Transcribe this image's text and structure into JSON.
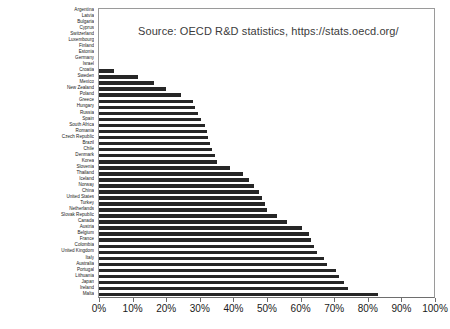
{
  "chart_data": {
    "type": "bar",
    "orientation": "horizontal",
    "title": "Source: OECD R&D statistics, https://stats.oecd.org/",
    "xlabel": "",
    "ylabel": "",
    "xlim": [
      0,
      100
    ],
    "xtick_labels": [
      "0%",
      "10%",
      "20%",
      "30%",
      "40%",
      "50%",
      "60%",
      "70%",
      "80%",
      "90%",
      "100%"
    ],
    "xtick_values": [
      0,
      10,
      20,
      30,
      40,
      50,
      60,
      70,
      80,
      90,
      100
    ],
    "grid": false,
    "legend": false,
    "bar_color": "#262626",
    "categories": [
      "Argentina",
      "Latvia",
      "Bulgaria",
      "Cyprus",
      "Switzerland",
      "Luxembourg",
      "Finland",
      "Estonia",
      "Germany",
      "Israel",
      "Croatia",
      "Sweden",
      "Mexico",
      "New Zealand",
      "Poland",
      "Greece",
      "Hungary",
      "Russia",
      "Spain",
      "South Africa",
      "Romania",
      "Czech Republic",
      "Brazil",
      "Chile",
      "Denmark",
      "Korea",
      "Slovenia",
      "Thailand",
      "Iceland",
      "Norway",
      "China",
      "United States",
      "Turkey",
      "Netherlands",
      "Slovak Republic",
      "Canada",
      "Austria",
      "Belgium",
      "France",
      "Colombia",
      "United Kingdom",
      "Italy",
      "Australia",
      "Portugal",
      "Lithuania",
      "Japan",
      "Ireland",
      "Malta"
    ],
    "values": [
      0,
      0,
      0,
      0,
      0,
      0,
      0,
      0,
      0,
      0,
      4.5,
      11.5,
      16.5,
      20.0,
      24.5,
      28.0,
      28.5,
      29.5,
      30.5,
      31.5,
      32.0,
      32.5,
      33.0,
      33.5,
      34.5,
      35.0,
      39.0,
      43.0,
      44.5,
      46.0,
      47.5,
      48.5,
      49.5,
      50.0,
      53.0,
      56.0,
      60.5,
      62.5,
      63.0,
      64.0,
      65.0,
      67.0,
      68.0,
      70.5,
      71.5,
      73.0,
      74.0,
      83.0
    ]
  },
  "annotations": {
    "source_note": "Source: OECD R&D statistics, https://stats.oecd.org/"
  }
}
